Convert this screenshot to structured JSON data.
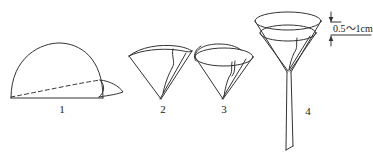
{
  "diagram": {
    "background_color": "#ffffff",
    "line_color": "#333333",
    "text_color": "#1a1a1a",
    "steps": [
      {
        "number": "1",
        "name": "semicircular-filter-paper",
        "description": "Filter paper folded in half into a semicircle with fold line shown dashed"
      },
      {
        "number": "2",
        "name": "quarter-folded-filter-paper",
        "description": "Filter paper folded again into a quarter-circle wedge"
      },
      {
        "number": "3",
        "name": "opened-paper-cone",
        "description": "Folded paper opened into a cone with three layers on one side"
      },
      {
        "number": "4",
        "name": "funnel-with-filter-paper",
        "description": "Paper cone seated inside the glass funnel with stem"
      }
    ],
    "annotation": {
      "name": "rim-gap-dimension",
      "text": "0.5～1cm",
      "meaning": "Gap between funnel rim and filter paper edge"
    }
  }
}
